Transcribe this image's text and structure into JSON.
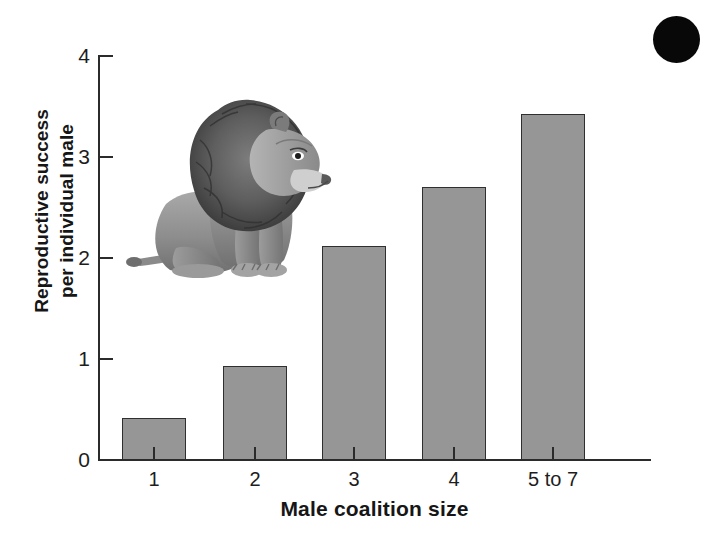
{
  "figure": {
    "background_color": "#ffffff",
    "bar_fill_color": "#969696",
    "bar_edge_color": "#2f2f2f",
    "axis_color": "#2b2b2b",
    "corner_marker_color": "#080808",
    "corner_marker_name": "black-circle-marker",
    "illustration_name": "lion-illustration",
    "illustration_caption": "sitting male lion"
  },
  "chart_data": {
    "type": "bar",
    "title": "",
    "subtitle": "",
    "xlabel": "Male coalition size",
    "ylabel": "Reproductive success per individual male",
    "ylabel_line1": "Reproductive success",
    "ylabel_line2": "per individual male",
    "categories": [
      "1",
      "2",
      "3",
      "4",
      "5 to 7"
    ],
    "values": [
      0.41,
      0.93,
      2.11,
      2.7,
      3.42
    ],
    "ylim": [
      0,
      4
    ],
    "yticks": [
      0,
      1,
      2,
      3,
      4
    ],
    "ytick_labels": [
      "0",
      "1",
      "2",
      "3",
      "4"
    ],
    "grid": false,
    "legend": null,
    "series": [
      {
        "name": "Reproductive success per individual male",
        "values": [
          0.41,
          0.93,
          2.11,
          2.7,
          3.42
        ]
      }
    ]
  }
}
